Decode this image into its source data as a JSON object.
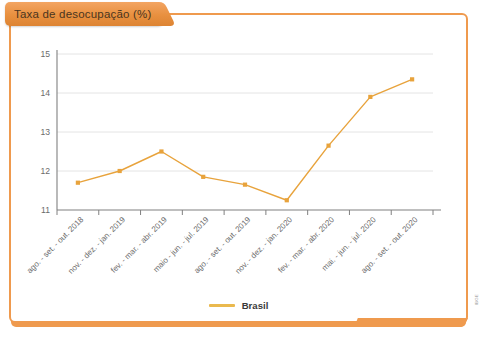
{
  "panel": {
    "title": "Taxa de desocupação (%)",
    "accent_color": "#ef9a4e",
    "title_tab_color": "#e8903f",
    "background": "#ffffff"
  },
  "legend": {
    "position": "bottom-center",
    "entries": [
      {
        "label": "Brasil",
        "color": "#eab94e"
      }
    ]
  },
  "source_credit": "IBGE",
  "chart_data": {
    "type": "line",
    "title": "Taxa de desocupação (%)",
    "xlabel": "",
    "ylabel": "",
    "ylim": [
      11,
      15
    ],
    "yticks": [
      11,
      12,
      13,
      14,
      15
    ],
    "grid": true,
    "categories": [
      "ago. - set. - out. 2018",
      "nov. - dez. - jan. 2019",
      "fev. - mar. - abr. 2019",
      "maio - jun. - jul. 2019",
      "ago. - set. - out. 2019",
      "nov. - dez. - jan. 2020",
      "fev. - mar. - abr. 2020",
      "mai. - jun. - jul. 2020",
      "ago. - set. - out. 2020"
    ],
    "series": [
      {
        "name": "Brasil",
        "color": "#e8a33c",
        "values": [
          11.7,
          12.0,
          12.5,
          11.85,
          11.65,
          11.25,
          12.65,
          13.9,
          14.35
        ]
      }
    ]
  }
}
